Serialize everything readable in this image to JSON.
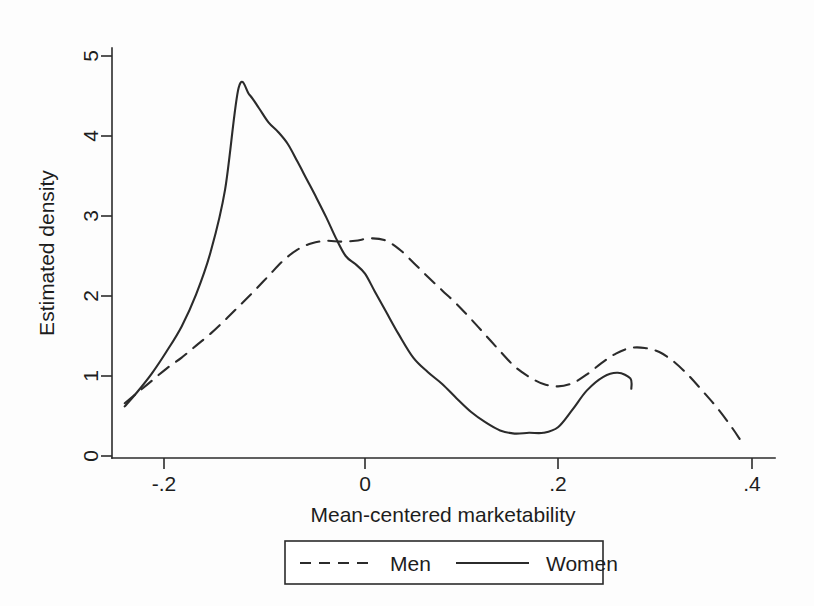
{
  "figure": {
    "background_color": "#fdfdfd",
    "ink_color": "#2b2b2b"
  },
  "chart_data": {
    "type": "line",
    "title": "",
    "xlabel": "Mean-centered marketability",
    "ylabel": "Estimated density",
    "xlim": [
      -0.255,
      0.42
    ],
    "ylim": [
      0,
      5.2
    ],
    "xticks": [
      -0.2,
      0,
      0.2,
      0.4
    ],
    "xtick_labels": [
      "-.2",
      "0",
      ".2",
      ".4"
    ],
    "yticks": [
      0,
      1,
      2,
      3,
      4,
      5
    ],
    "ytick_labels": [
      "0",
      "1",
      "2",
      "3",
      "4",
      "5"
    ],
    "grid": false,
    "legend_position": "below-center",
    "series": [
      {
        "name": "Men",
        "style": "dashed",
        "color": "#2b2b2b",
        "x": [
          -0.249,
          -0.236,
          -0.221,
          -0.206,
          -0.19,
          -0.175,
          -0.16,
          -0.145,
          -0.13,
          -0.115,
          -0.1,
          -0.085,
          -0.07,
          -0.055,
          -0.04,
          -0.025,
          -0.01,
          0.005,
          0.02,
          0.035,
          0.05,
          0.065,
          0.08,
          0.095,
          0.11,
          0.125,
          0.14,
          0.155,
          0.17,
          0.185,
          0.2,
          0.215,
          0.23,
          0.245,
          0.26,
          0.275,
          0.29,
          0.305,
          0.32,
          0.335,
          0.35,
          0.365,
          0.38,
          0.389
        ],
        "y": [
          0.66,
          0.79,
          0.94,
          1.09,
          1.23,
          1.38,
          1.53,
          1.7,
          1.88,
          2.06,
          2.25,
          2.44,
          2.58,
          2.66,
          2.69,
          2.68,
          2.69,
          2.72,
          2.7,
          2.59,
          2.42,
          2.24,
          2.07,
          1.9,
          1.71,
          1.51,
          1.31,
          1.12,
          0.99,
          0.9,
          0.87,
          0.91,
          1.02,
          1.16,
          1.28,
          1.35,
          1.35,
          1.3,
          1.18,
          1.01,
          0.81,
          0.6,
          0.36,
          0.2
        ]
      },
      {
        "name": "Women",
        "style": "solid",
        "color": "#2b2b2b",
        "x": [
          -0.249,
          -0.236,
          -0.221,
          -0.206,
          -0.19,
          -0.175,
          -0.16,
          -0.145,
          -0.131,
          -0.12,
          -0.11,
          -0.1,
          -0.09,
          -0.08,
          -0.07,
          -0.06,
          -0.05,
          -0.04,
          -0.03,
          -0.02,
          -0.01,
          0.0,
          0.01,
          0.022,
          0.035,
          0.05,
          0.065,
          0.08,
          0.095,
          0.11,
          0.125,
          0.14,
          0.155,
          0.17,
          0.185,
          0.2,
          0.215,
          0.23,
          0.247,
          0.262,
          0.275,
          0.276
        ],
        "y": [
          0.62,
          0.8,
          1.03,
          1.3,
          1.62,
          2.02,
          2.55,
          3.33,
          4.6,
          4.52,
          4.35,
          4.17,
          4.05,
          3.9,
          3.68,
          3.45,
          3.22,
          2.98,
          2.72,
          2.5,
          2.4,
          2.28,
          2.06,
          1.8,
          1.52,
          1.23,
          1.05,
          0.9,
          0.72,
          0.55,
          0.42,
          0.32,
          0.28,
          0.29,
          0.29,
          0.36,
          0.58,
          0.82,
          0.99,
          1.04,
          0.97,
          0.84
        ]
      }
    ]
  },
  "legend": {
    "entries": [
      {
        "label": "Men",
        "style": "dashed"
      },
      {
        "label": "Women",
        "style": "solid"
      }
    ]
  }
}
